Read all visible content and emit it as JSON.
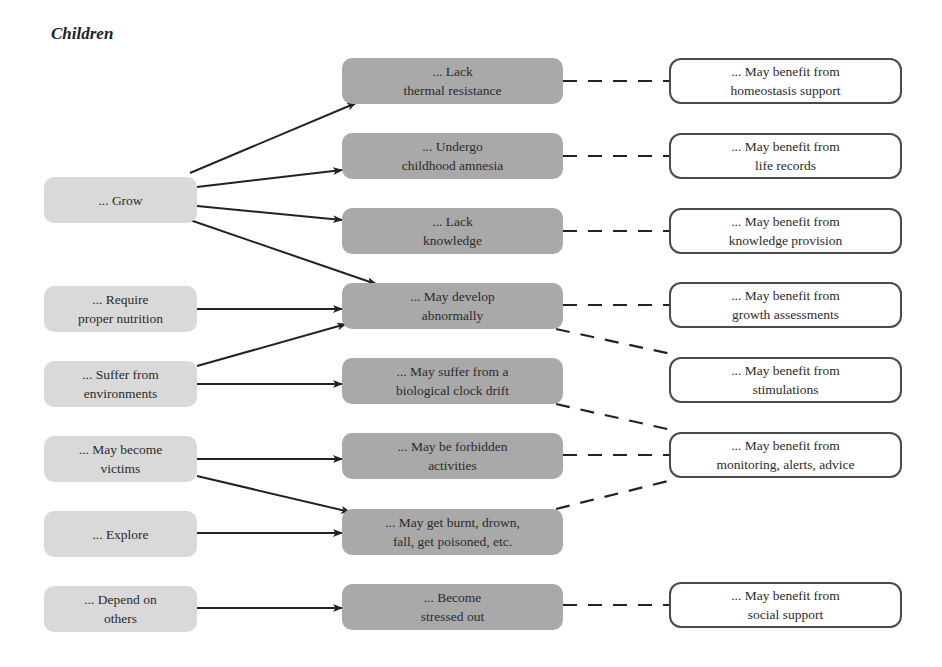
{
  "title": "Children",
  "colors": {
    "cause_fill": "#d9d9d9",
    "effect_fill": "#a9a9a9",
    "benefit_fill": "#ffffff",
    "benefit_border": "#4a4a4a",
    "arrow": "#222222",
    "dash": "#222222"
  },
  "causes": [
    {
      "id": "grow",
      "label": "... Grow"
    },
    {
      "id": "nutrition",
      "label": "... Require\nproper nutrition"
    },
    {
      "id": "environments",
      "label": "... Suffer from\nenvironments"
    },
    {
      "id": "victims",
      "label": "... May become\nvictims"
    },
    {
      "id": "explore",
      "label": "... Explore"
    },
    {
      "id": "depend",
      "label": "... Depend on\nothers"
    }
  ],
  "effects": [
    {
      "id": "thermal",
      "label": "... Lack\nthermal resistance"
    },
    {
      "id": "amnesia",
      "label": "... Undergo\nchildhood amnesia"
    },
    {
      "id": "knowledge",
      "label": "... Lack\nknowledge"
    },
    {
      "id": "abnormal",
      "label": "... May develop\nabnormally"
    },
    {
      "id": "clock",
      "label": "... May suffer from a\nbiological clock drift"
    },
    {
      "id": "forbidden",
      "label": "... May be forbidden\nactivities"
    },
    {
      "id": "burnt",
      "label": "... May get burnt, drown,\nfall, get poisoned, etc."
    },
    {
      "id": "stressed",
      "label": "... Become\nstressed out"
    }
  ],
  "benefits": [
    {
      "id": "homeostasis",
      "label": "... May benefit from\nhomeostasis support"
    },
    {
      "id": "liferecords",
      "label": "... May benefit from\nlife records"
    },
    {
      "id": "knowprov",
      "label": "... May benefit from\nknowledge provision"
    },
    {
      "id": "growth",
      "label": "... May benefit from\ngrowth assessments"
    },
    {
      "id": "stimulations",
      "label": "... May benefit from\nstimulations"
    },
    {
      "id": "monitoring",
      "label": "... May benefit from\nmonitoring, alerts, advice"
    },
    {
      "id": "social",
      "label": "... May benefit from\nsocial support"
    }
  ],
  "arrows": [
    {
      "from": "grow",
      "to": "thermal"
    },
    {
      "from": "grow",
      "to": "amnesia"
    },
    {
      "from": "grow",
      "to": "knowledge"
    },
    {
      "from": "grow",
      "to": "abnormal"
    },
    {
      "from": "nutrition",
      "to": "abnormal"
    },
    {
      "from": "environments",
      "to": "abnormal"
    },
    {
      "from": "environments",
      "to": "clock"
    },
    {
      "from": "victims",
      "to": "forbidden"
    },
    {
      "from": "victims",
      "to": "burnt"
    },
    {
      "from": "explore",
      "to": "burnt"
    },
    {
      "from": "depend",
      "to": "stressed"
    }
  ],
  "dashed_links": [
    {
      "from": "thermal",
      "to": "homeostasis"
    },
    {
      "from": "amnesia",
      "to": "liferecords"
    },
    {
      "from": "knowledge",
      "to": "knowprov"
    },
    {
      "from": "abnormal",
      "to": "growth"
    },
    {
      "from": "abnormal",
      "to": "stimulations"
    },
    {
      "from": "clock",
      "to": "monitoring"
    },
    {
      "from": "forbidden",
      "to": "monitoring"
    },
    {
      "from": "burnt",
      "to": "monitoring"
    },
    {
      "from": "stressed",
      "to": "social"
    }
  ]
}
